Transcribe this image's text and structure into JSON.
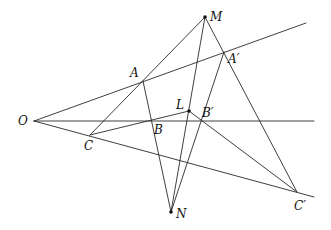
{
  "diagram": {
    "type": "projective-geometry-figure",
    "colors": {
      "stroke": "#2a2a2a",
      "label": "#111111",
      "background": "#ffffff"
    },
    "points": {
      "O": {
        "label": "O",
        "x": 34,
        "y": 121,
        "label_dx": -16,
        "label_dy": 4
      },
      "A": {
        "label": "A",
        "x": 143,
        "y": 81,
        "label_dx": -13,
        "label_dy": -4
      },
      "B": {
        "label": "B",
        "x": 152,
        "y": 121,
        "label_dx": 2,
        "label_dy": 13
      },
      "C": {
        "label": "C",
        "x": 90,
        "y": 135,
        "label_dx": -6,
        "label_dy": 15
      },
      "A_prime": {
        "label": "A′",
        "x": 224,
        "y": 52,
        "label_dx": 4,
        "label_dy": 11
      },
      "B_prime": {
        "label": "B′",
        "x": 201,
        "y": 121,
        "label_dx": 1,
        "label_dy": -4
      },
      "C_prime": {
        "label": "C′",
        "x": 297,
        "y": 192,
        "label_dx": -3,
        "label_dy": 18
      },
      "L": {
        "label": "L",
        "x": 189,
        "y": 111,
        "label_dx": -13,
        "label_dy": -2
      },
      "M": {
        "label": "M",
        "x": 205,
        "y": 17,
        "label_dx": 5,
        "label_dy": 4
      },
      "N": {
        "label": "N",
        "x": 171,
        "y": 212,
        "label_dx": 5,
        "label_dy": 6
      }
    },
    "dots": [
      "M",
      "N",
      "L"
    ],
    "segments": [
      {
        "name": "ray-O-A-A'",
        "from": [
          34,
          121
        ],
        "to": [
          306,
          23
        ]
      },
      {
        "name": "ray-O-B-B'",
        "from": [
          34,
          121
        ],
        "to": [
          314,
          121
        ]
      },
      {
        "name": "ray-O-C-C'",
        "from": [
          34,
          121
        ],
        "to": [
          314,
          197
        ]
      },
      {
        "name": "line-M-A-C",
        "from": [
          205,
          17
        ],
        "to": [
          90,
          135
        ]
      },
      {
        "name": "line-M-A'-C'",
        "from": [
          205,
          17
        ],
        "to": [
          297,
          192
        ]
      },
      {
        "name": "line-M-L-N",
        "from": [
          205,
          17
        ],
        "to": [
          171,
          212
        ]
      },
      {
        "name": "line-A-B-N",
        "from": [
          143,
          81
        ],
        "to": [
          171,
          212
        ]
      },
      {
        "name": "line-A'-B'-N",
        "from": [
          224,
          52
        ],
        "to": [
          171,
          212
        ]
      },
      {
        "name": "line-C-B-L",
        "from": [
          90,
          135
        ],
        "to": [
          189,
          111
        ]
      },
      {
        "name": "line-L-B'-C'",
        "from": [
          189,
          111
        ],
        "to": [
          297,
          192
        ]
      }
    ]
  }
}
